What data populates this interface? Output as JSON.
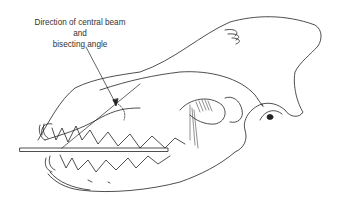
{
  "diagram": {
    "label": {
      "line1": "Direction of central beam",
      "line2": "and",
      "line3": "bisecting angle"
    },
    "elements": [
      "skull-outline",
      "upper-teeth",
      "lower-teeth",
      "mandible",
      "orbit",
      "zygomatic-arch",
      "film-bar",
      "beam-line",
      "bisecting-line",
      "angle-arc"
    ]
  }
}
